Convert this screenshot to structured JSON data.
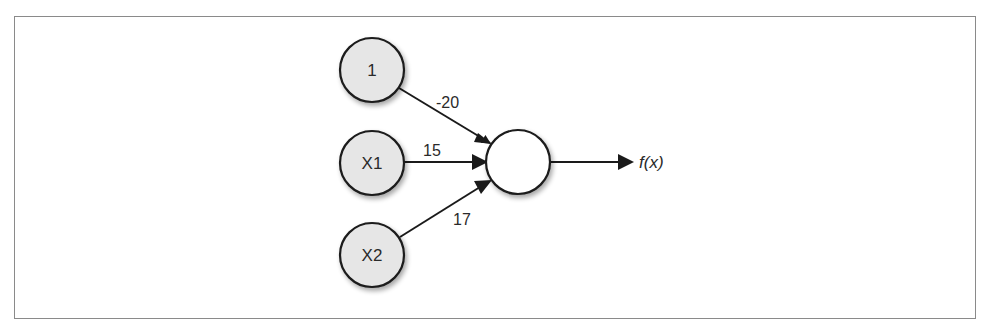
{
  "diagram": {
    "type": "perceptron",
    "inputs": [
      {
        "id": "bias",
        "label": "1",
        "weight": "-20"
      },
      {
        "id": "x1",
        "label": "X1",
        "weight": "15"
      },
      {
        "id": "x2",
        "label": "X2",
        "weight": "17"
      }
    ],
    "output_node": {
      "label": ""
    },
    "output": {
      "label": "f(x)"
    },
    "colors": {
      "input_fill": "#e6e6e6",
      "output_fill": "#ffffff",
      "stroke": "#1a1a1a",
      "frame_border": "#8a8a8a"
    }
  }
}
